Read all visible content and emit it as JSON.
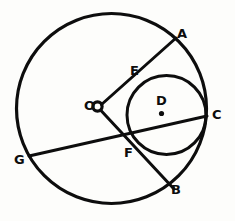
{
  "figure": {
    "kind": "geometry-diagram",
    "background_color": "#fdfdfb",
    "ink_color": "#0d0d0d",
    "canvas": {
      "width": 235,
      "height": 221
    }
  },
  "shapes": {
    "outer_circle": {
      "name": "outer-circle",
      "cx": 111.5,
      "cy": 108.5,
      "r": 95.0,
      "stroke_width": 3.2
    },
    "inner_circle": {
      "name": "inner-circle",
      "cx": 166.5,
      "cy": 115.0,
      "r": 39.5,
      "stroke_width": 3.0
    },
    "center_marker_outer": {
      "name": "outer-center-ring",
      "cx": 97.5,
      "cy": 106.5,
      "r": 4.6,
      "stroke_width": 3.2
    },
    "center_marker_inner": {
      "name": "inner-center-dot",
      "cx": 161.5,
      "cy": 113.5,
      "r": 2.6
    }
  },
  "segments": [
    {
      "name": "segment-O-A",
      "from": "O",
      "to": "A",
      "x1": 101.5,
      "y1": 104.5,
      "x2": 176.0,
      "y2": 38.0,
      "stroke_width": 3.0
    },
    {
      "name": "segment-O-B",
      "from": "O",
      "to": "B",
      "x1": 100.5,
      "y1": 110.0,
      "x2": 174.0,
      "y2": 189.0,
      "stroke_width": 3.0
    },
    {
      "name": "chord-G-C",
      "from": "G",
      "to": "C",
      "x1": 29.0,
      "y1": 156.0,
      "x2": 207.0,
      "y2": 116.0,
      "stroke_width": 3.0
    }
  ],
  "labels": [
    {
      "name": "point-label-A",
      "text": "A",
      "x": 177,
      "y": 27
    },
    {
      "name": "point-label-E",
      "text": "E",
      "x": 130,
      "y": 64
    },
    {
      "name": "point-label-D",
      "text": "D",
      "x": 156,
      "y": 94
    },
    {
      "name": "point-label-C",
      "text": "C",
      "x": 212,
      "y": 108
    },
    {
      "name": "point-label-O",
      "text": "O",
      "x": 84,
      "y": 99
    },
    {
      "name": "point-label-F",
      "text": "F",
      "x": 124,
      "y": 146
    },
    {
      "name": "point-label-G",
      "text": "G",
      "x": 14,
      "y": 153
    },
    {
      "name": "point-label-B",
      "text": "B",
      "x": 171,
      "y": 183
    }
  ]
}
